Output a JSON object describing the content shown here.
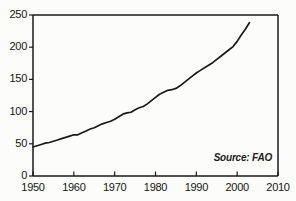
{
  "chart_data": {
    "type": "line",
    "title": "Million Tons",
    "xlabel": "",
    "ylabel": "Million Tons",
    "xlim": [
      1950,
      2010
    ],
    "ylim": [
      0,
      250
    ],
    "grid": false,
    "legend": null,
    "annotations": [
      {
        "text": "Source: FAO",
        "position": "bottom-right-inside"
      }
    ],
    "xticks": [
      "1950",
      "1960",
      "1970",
      "1980",
      "1990",
      "2000",
      "2010"
    ],
    "yticks": [
      "0",
      "50",
      "100",
      "150",
      "200",
      "250"
    ],
    "series": [
      {
        "name": "World Production",
        "x": [
          1950,
          1951,
          1952,
          1953,
          1954,
          1955,
          1956,
          1957,
          1958,
          1959,
          1960,
          1961,
          1962,
          1963,
          1964,
          1965,
          1966,
          1967,
          1968,
          1969,
          1970,
          1971,
          1972,
          1973,
          1974,
          1975,
          1976,
          1977,
          1978,
          1979,
          1980,
          1981,
          1982,
          1983,
          1984,
          1985,
          1986,
          1987,
          1988,
          1989,
          1990,
          1991,
          1992,
          1993,
          1994,
          1995,
          1996,
          1997,
          1998,
          1999,
          2000,
          2001,
          2002,
          2003
        ],
        "values": [
          45,
          47,
          49,
          51,
          52,
          54,
          56,
          58,
          60,
          62,
          64,
          64,
          67,
          70,
          73,
          75,
          78,
          81,
          83,
          85,
          88,
          92,
          96,
          98,
          99,
          103,
          106,
          108,
          112,
          117,
          122,
          127,
          130,
          133,
          134,
          136,
          140,
          145,
          150,
          155,
          160,
          164,
          168,
          172,
          176,
          181,
          186,
          191,
          196,
          201,
          209,
          219,
          228,
          238
        ]
      }
    ]
  },
  "labels": {
    "source_note": "Source: FAO",
    "axis_title": "Million Tons"
  }
}
